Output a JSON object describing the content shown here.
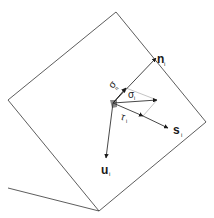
{
  "diagram": {
    "plane_square": {
      "points": [
        [
          116,
          12
        ],
        [
          8,
          100
        ],
        [
          99,
          211
        ],
        [
          206,
          122
        ]
      ],
      "stroke": "#333333"
    },
    "ground_line": {
      "from": [
        8,
        188
      ],
      "to": [
        99,
        211
      ]
    },
    "origin": [
      113,
      103
    ],
    "vectors": [
      {
        "id": "n",
        "to": [
          156,
          58
        ],
        "label": "n",
        "subscript": "i",
        "bold": true
      },
      {
        "id": "sigma_n",
        "to": [
          126,
          88
        ],
        "label": "σ",
        "subscript": "n"
      },
      {
        "id": "sigma_i",
        "to": [
          157,
          100
        ],
        "label": "σ",
        "subscript": "i"
      },
      {
        "id": "tau_i",
        "to": [
          143,
          116
        ],
        "label": "τ",
        "subscript": "i"
      },
      {
        "id": "s",
        "to": [
          168,
          128
        ],
        "label": "s",
        "subscript": "i",
        "bold": true
      },
      {
        "id": "u",
        "to": [
          106,
          158
        ],
        "label": "u",
        "subscript": "i",
        "bold": true
      }
    ]
  },
  "labels": {
    "n_main": "n",
    "n_sub": "i",
    "sigma_n_main": "σ",
    "sigma_n_sub": "n",
    "sigma_i_main": "σ",
    "sigma_i_sub": "i",
    "tau_main": "τ",
    "tau_sub": "i",
    "s_main": "s",
    "s_sub": "i",
    "u_main": "u",
    "u_sub": "i"
  },
  "colors": {
    "line": "#333333",
    "guide": "#b5b5b5",
    "origin_marker": "#8a8a8a"
  }
}
